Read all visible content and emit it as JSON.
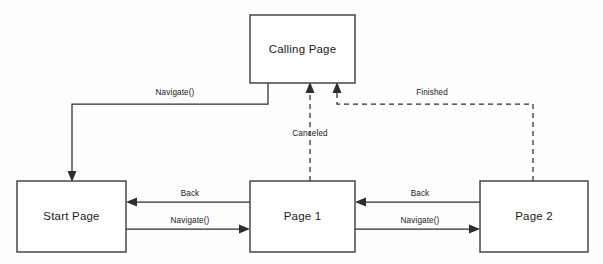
{
  "diagram": {
    "background_color": "#fdfdfd",
    "stroke_color": "#2d2d2d",
    "box_fill_color": "#ffffff",
    "nodes": [
      {
        "id": "calling_page",
        "label": "Calling Page",
        "x": 250,
        "y": 15,
        "w": 105,
        "h": 68
      },
      {
        "id": "start_page",
        "label": "Start Page",
        "x": 17,
        "y": 181,
        "w": 109,
        "h": 71
      },
      {
        "id": "page_1",
        "label": "Page 1",
        "x": 250,
        "y": 181,
        "w": 105,
        "h": 71
      },
      {
        "id": "page_2",
        "label": "Page 2",
        "x": 480,
        "y": 181,
        "w": 108,
        "h": 71
      }
    ],
    "edges": [
      {
        "id": "edge_navigate_calling_to_start",
        "label": "Navigate()",
        "from": "calling_page",
        "to": "start_page",
        "style": "solid",
        "label_x": 175,
        "label_y": 93
      },
      {
        "id": "edge_canceled_page1_to_calling",
        "label": "Canceled",
        "from": "page_1",
        "to": "calling_page",
        "style": "dashed",
        "label_x": 310,
        "label_y": 134
      },
      {
        "id": "edge_finished_page2_to_calling",
        "label": "Finished",
        "from": "page_2",
        "to": "calling_page",
        "style": "dashed",
        "label_x": 432,
        "label_y": 93
      },
      {
        "id": "edge_back_page1_to_start",
        "label": "Back",
        "from": "page_1",
        "to": "start_page",
        "style": "solid",
        "label_x": 190,
        "label_y": 194
      },
      {
        "id": "edge_navigate_start_to_page1",
        "label": "Navigate()",
        "from": "start_page",
        "to": "page_1",
        "style": "solid",
        "label_x": 190,
        "label_y": 221
      },
      {
        "id": "edge_back_page2_to_page1",
        "label": "Back",
        "from": "page_2",
        "to": "page_1",
        "style": "solid",
        "label_x": 420,
        "label_y": 194
      },
      {
        "id": "edge_navigate_page1_to_page2",
        "label": "Navigate()",
        "from": "page_1",
        "to": "page_2",
        "style": "solid",
        "label_x": 420,
        "label_y": 221
      }
    ]
  }
}
